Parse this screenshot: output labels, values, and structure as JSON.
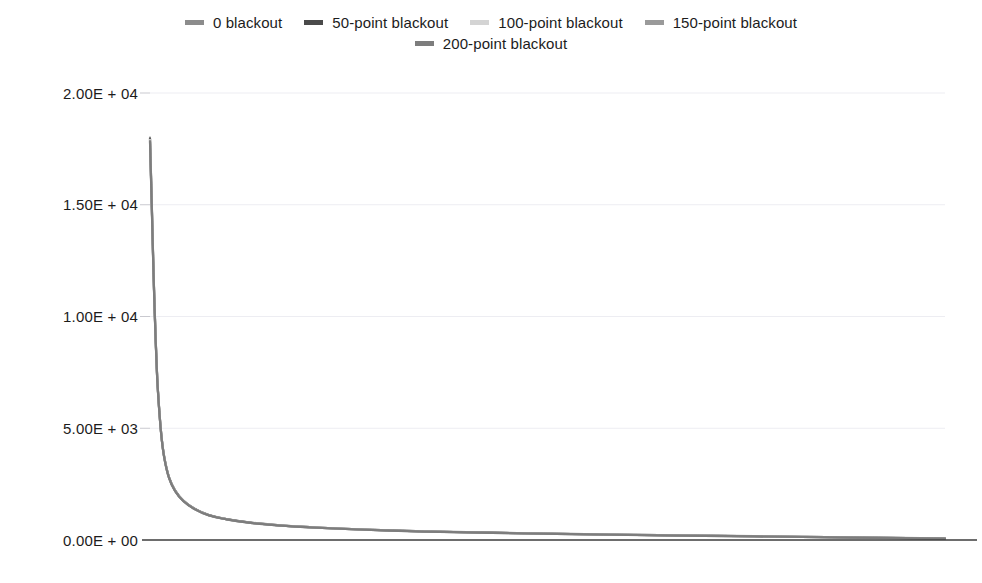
{
  "chart_data": {
    "type": "line",
    "title": "",
    "subtitle": "",
    "xlabel": "",
    "ylabel": "",
    "grid": true,
    "legend_position": "top",
    "xlim": [
      0,
      1000
    ],
    "ylim": [
      0,
      20000
    ],
    "yticks": [
      0,
      5000,
      10000,
      15000,
      20000
    ],
    "ytick_labels": [
      "0.00E + 00",
      "5.00E + 03",
      "1.00E + 04",
      "1.50E + 04",
      "2.00E + 04"
    ],
    "xticks": [],
    "xtick_labels": [],
    "series": [
      {
        "name": "0 blackout",
        "color": "#8c8c8c",
        "x": [
          0,
          2,
          4,
          6,
          8,
          10,
          14,
          18,
          24,
          32,
          42,
          56,
          74,
          96,
          124,
          160,
          210,
          270,
          345,
          430,
          530,
          640,
          760,
          880,
          1000
        ],
        "values": [
          18000,
          15400,
          12600,
          10200,
          8200,
          6700,
          4800,
          3700,
          2800,
          2200,
          1760,
          1400,
          1120,
          940,
          790,
          670,
          560,
          470,
          390,
          330,
          270,
          220,
          170,
          120,
          70
        ]
      },
      {
        "name": "50-point blackout",
        "color": "#4a4a4a",
        "x": [
          0,
          2,
          4,
          6,
          8,
          10,
          14,
          18,
          24,
          32,
          42,
          56,
          74,
          96,
          124,
          160,
          210,
          270,
          345,
          430,
          530,
          640,
          760,
          880,
          1000
        ],
        "values": [
          17950,
          15350,
          12560,
          10170,
          8180,
          6680,
          4790,
          3690,
          2790,
          2190,
          1755,
          1395,
          1115,
          935,
          786,
          666,
          557,
          467,
          387,
          327,
          268,
          218,
          168,
          118,
          68
        ]
      },
      {
        "name": "100-point blackout",
        "color": "#d4d4d4",
        "x": [
          0,
          2,
          4,
          6,
          8,
          10,
          14,
          18,
          24,
          32,
          42,
          56,
          74,
          96,
          124,
          160,
          210,
          270,
          345,
          430,
          530,
          640,
          760,
          880,
          1000
        ],
        "values": [
          17900,
          15300,
          12520,
          10140,
          8160,
          6660,
          4780,
          3680,
          2780,
          2180,
          1750,
          1390,
          1110,
          930,
          782,
          662,
          554,
          464,
          384,
          324,
          266,
          216,
          166,
          116,
          66
        ]
      },
      {
        "name": "150-point blackout",
        "color": "#9a9a9a",
        "x": [
          0,
          2,
          4,
          6,
          8,
          10,
          14,
          18,
          24,
          32,
          42,
          56,
          74,
          96,
          124,
          160,
          210,
          270,
          345,
          430,
          530,
          640,
          760,
          880,
          1000
        ],
        "values": [
          17860,
          15260,
          12490,
          10110,
          8140,
          6645,
          4770,
          3672,
          2772,
          2172,
          1745,
          1386,
          1106,
          926,
          778,
          658,
          551,
          461,
          381,
          321,
          263,
          213,
          163,
          113,
          63
        ]
      },
      {
        "name": "200-point blackout",
        "color": "#7d7d7d",
        "x": [
          0,
          2,
          4,
          6,
          8,
          10,
          14,
          18,
          24,
          32,
          42,
          56,
          74,
          96,
          124,
          160,
          210,
          270,
          345,
          430,
          530,
          640,
          760,
          880,
          1000
        ],
        "values": [
          17820,
          15220,
          12460,
          10080,
          8120,
          6630,
          4760,
          3665,
          2765,
          2165,
          1740,
          1382,
          1102,
          922,
          774,
          654,
          548,
          458,
          378,
          318,
          260,
          210,
          160,
          110,
          60
        ]
      }
    ]
  },
  "legend": {
    "rows": [
      [
        {
          "label": "0 blackout",
          "color": "#8c8c8c"
        },
        {
          "label": "50-point blackout",
          "color": "#4a4a4a"
        },
        {
          "label": "100-point blackout",
          "color": "#d4d4d4"
        },
        {
          "label": "150-point blackout",
          "color": "#9a9a9a"
        }
      ],
      [
        {
          "label": "200-point blackout",
          "color": "#7d7d7d"
        }
      ]
    ]
  },
  "axes": {
    "y_tick_labels": [
      "2.00E + 04",
      "1.50E + 04",
      "1.00E + 04",
      "5.00E + 03",
      "0.00E + 00"
    ]
  },
  "colors": {
    "background": "#ffffff",
    "gridline": "#ededf2",
    "baseline": "#3d3d3d",
    "text": "#1c1c1c"
  }
}
